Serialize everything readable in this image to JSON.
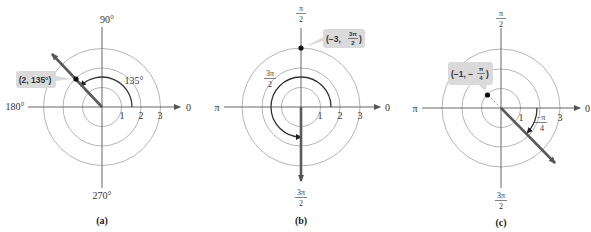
{
  "figure": {
    "panels": [
      {
        "id": "a",
        "caption": "(a)",
        "axis_labels": {
          "top": "90°",
          "left": "180°",
          "right": "0",
          "bottom": "270°"
        },
        "ring_labels": [
          "1",
          "2",
          "3"
        ],
        "angle_label": "135°",
        "point_label": "(2, 135°)",
        "point": {
          "r": 2,
          "theta_deg": 135
        }
      },
      {
        "id": "b",
        "caption": "(b)",
        "axis_labels": {
          "top_num": "π",
          "top_den": "2",
          "left": "π",
          "right": "0",
          "bottom_num": "3π",
          "bottom_den": "2"
        },
        "ring_labels": [
          "1",
          "2",
          "3"
        ],
        "angle_label_num": "3π",
        "angle_label_den": "2",
        "point_label_prefix": "(−3, ",
        "point_label_num": "3π",
        "point_label_den": "2",
        "point_label_suffix": ")",
        "point": {
          "r": -3,
          "theta": "3π/2"
        }
      },
      {
        "id": "c",
        "caption": "(c)",
        "axis_labels": {
          "top_num": "π",
          "top_den": "2",
          "left": "π",
          "right": "0",
          "bottom_num": "3π",
          "bottom_den": "2"
        },
        "ring_labels": [
          "1",
          "3"
        ],
        "angle_label_num": "−π",
        "angle_label_den": "4",
        "point_label_prefix": "(−1, −",
        "point_label_num": "π",
        "point_label_den": "4",
        "point_label_suffix": ")",
        "point": {
          "r": -1,
          "theta": "−π/4"
        }
      }
    ],
    "colors": {
      "ring": "#b0b0b0",
      "axis": "#555555",
      "ray": "#5a5a5a",
      "arc": "#333333",
      "callout_bg": "#d9d9d9",
      "point": "#111111"
    }
  }
}
